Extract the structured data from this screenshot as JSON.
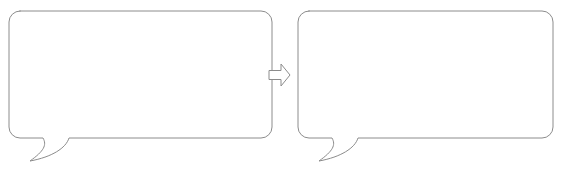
{
  "canvas": {
    "width": 561,
    "height": 179,
    "background_color": "#ffffff",
    "stroke_color": "#8c8c8c",
    "fill_color": "#ffffff",
    "stroke_width": 1
  },
  "diagram": {
    "type": "before-after-transformation",
    "title": "",
    "element_count": 3,
    "elements": [
      {
        "name": "source-speech-bubble",
        "role": "before",
        "shape": "rounded-rectangle-speech-balloon",
        "label": "",
        "body": {
          "x": 9,
          "y": 11,
          "width": 263,
          "height": 127,
          "corner_radius": 11
        },
        "tail": {
          "position": "bottom-left",
          "direction": "down-left",
          "style": "curved-hook",
          "attach_start_x": 43,
          "attach_end_x": 69,
          "attach_y": 138,
          "tip_x": 30,
          "tip_y": 161
        }
      },
      {
        "name": "transform-arrow",
        "role": "connector",
        "shape": "block-arrow",
        "label": "",
        "direction": "right",
        "geometry": {
          "x": 269,
          "y": 64,
          "width": 21,
          "height": 22,
          "shaft_height": 9,
          "head_width": 9
        }
      },
      {
        "name": "result-speech-bubble",
        "role": "after",
        "shape": "rounded-rectangle-speech-balloon",
        "label": "",
        "body": {
          "x": 298,
          "y": 11,
          "width": 255,
          "height": 127,
          "corner_radius": 11
        },
        "tail": {
          "position": "bottom-left",
          "direction": "down-left",
          "style": "curved-hook",
          "attach_start_x": 332,
          "attach_end_x": 358,
          "attach_y": 138,
          "tip_x": 319,
          "tip_y": 161
        }
      }
    ]
  }
}
